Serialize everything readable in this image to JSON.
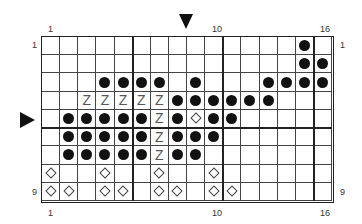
{
  "chart": {
    "cols": 16,
    "rows": 9,
    "col_labels_top": {
      "left": "1",
      "mid": "10",
      "right": "16"
    },
    "col_labels_bottom": {
      "left": "1",
      "mid": "10",
      "right": "16"
    },
    "row_labels_left": {
      "top": "1",
      "bottom": "9"
    },
    "row_labels_right": {
      "top": "1",
      "bottom": "9"
    },
    "markers": {
      "top_arrow": "down-pointing triangle between columns 8 and 9",
      "side_arrow": "right-pointing triangle at row 5"
    },
    "legend_symbols": {
      "dot": "filled circle",
      "Z": "Z symbol",
      "diamond": "open diamond",
      "empty": "blank"
    },
    "grid_rows": [
      "..............D..",
      "..............DD.",
      "...DDDD.D...DDDD",
      "..ZZZZZDDDDDD...",
      ".DDDDDZDXDD.....",
      ".DDDDDZDDD......",
      ".DDDDDZDD.......",
      "X..X..X..X......",
      "XX.XX.XX.XX....."
    ]
  }
}
